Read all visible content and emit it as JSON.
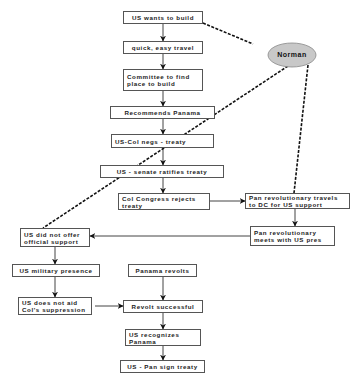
{
  "diagram": {
    "type": "flowchart",
    "nodes": {
      "n1": {
        "label": "US wants to build"
      },
      "n2": {
        "label": "quick, easy travel"
      },
      "n3": {
        "label": "Committee to find\nplace to build"
      },
      "n4": {
        "label": "Recommends Panama"
      },
      "n5": {
        "label": "US-Col negs - treaty"
      },
      "n6": {
        "label": "US - senate ratifies treaty"
      },
      "n7": {
        "label": "Col Congress rejects\ntreaty"
      },
      "n8": {
        "label": "Pan revolutionary travels\nto DC for US support"
      },
      "n9": {
        "label": "Pan revolutionary\nmeets with US pres"
      },
      "n10": {
        "label": "US did not offer\nofficial support"
      },
      "n11": {
        "label": "US military presence"
      },
      "n12": {
        "label": "Panama revolts"
      },
      "n13": {
        "label": "US does not aid\nCol's suppression"
      },
      "n14": {
        "label": "Revolt successful"
      },
      "n15": {
        "label": "US recognizes\nPanama"
      },
      "n16": {
        "label": "US - Pan sign treaty"
      }
    },
    "annotation": {
      "label": "Norman",
      "fill": "#c8c8c8"
    },
    "edges_solid": [
      [
        "n1",
        "n2"
      ],
      [
        "n2",
        "n3"
      ],
      [
        "n3",
        "n4"
      ],
      [
        "n4",
        "n5"
      ],
      [
        "n5",
        "n6"
      ],
      [
        "n6",
        "n7"
      ],
      [
        "n7",
        "n8"
      ],
      [
        "n8",
        "n9"
      ],
      [
        "n9",
        "n10"
      ],
      [
        "n10",
        "n11"
      ],
      [
        "n11",
        "n13"
      ],
      [
        "n13",
        "n14"
      ],
      [
        "n12",
        "n14"
      ],
      [
        "n14",
        "n15"
      ],
      [
        "n15",
        "n16"
      ]
    ],
    "edges_dashed": [
      [
        "Norman",
        "n1"
      ],
      [
        "Norman",
        "n10"
      ],
      [
        "Norman",
        "n8"
      ]
    ],
    "colors": {
      "border": "#555555",
      "line": "#222222",
      "ellipse_fill": "#c8c8c8"
    }
  }
}
